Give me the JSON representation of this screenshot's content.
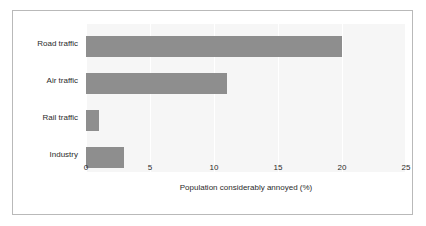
{
  "figure": {
    "background_color": "#ffffff",
    "border_color": "#b9b9b9",
    "plot_background_color": "#f6f6f6",
    "gridline_color": "#ffffff",
    "bar_color": "#8e8e8e"
  },
  "chart_data": {
    "type": "bar",
    "orientation": "horizontal",
    "title": "",
    "subtitle": "",
    "xlabel": "Population considerably annoyed (%)",
    "ylabel": "",
    "categories": [
      "Road traffic",
      "Air traffic",
      "Rail traffic",
      "Industry"
    ],
    "values": [
      20,
      11,
      1,
      3
    ],
    "series": [
      {
        "name": "Population considerably annoyed (%)",
        "values": [
          20,
          11,
          1,
          3
        ]
      }
    ],
    "xticks": [
      0,
      5,
      10,
      15,
      20,
      25
    ],
    "xticklabels": [
      "0",
      "5",
      "10",
      "15",
      "20",
      "25"
    ],
    "xlim": [
      0,
      25
    ],
    "grid": true,
    "grid_axis": "x",
    "legend": false,
    "legend_position": "none"
  }
}
